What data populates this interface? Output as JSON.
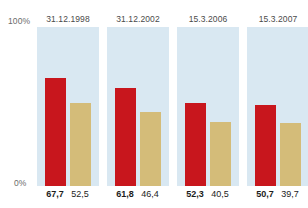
{
  "chart_data": {
    "type": "bar",
    "title": "",
    "xlabel": "",
    "ylabel": "",
    "ylim": [
      0,
      100
    ],
    "grid": false,
    "legend_position": "none",
    "categories": [
      "31.12.1998",
      "31.12.2002",
      "15.3.2006",
      "15.3.2007"
    ],
    "series": [
      {
        "name": "series-red",
        "color": "#c8161d",
        "values": [
          67.7,
          61.8,
          52.3,
          50.7
        ]
      },
      {
        "name": "series-beige",
        "color": "#d4bc79",
        "values": [
          52.5,
          46.4,
          40.5,
          39.7
        ]
      }
    ],
    "value_labels": [
      [
        "67,7",
        "52,5"
      ],
      [
        "61,8",
        "46,4"
      ],
      [
        "52,3",
        "40,5"
      ],
      [
        "50,7",
        "39,7"
      ]
    ],
    "axis": {
      "top_tick_label": "100%",
      "bottom_tick_label": "0%"
    },
    "panel_background": "#d9e8f2"
  }
}
